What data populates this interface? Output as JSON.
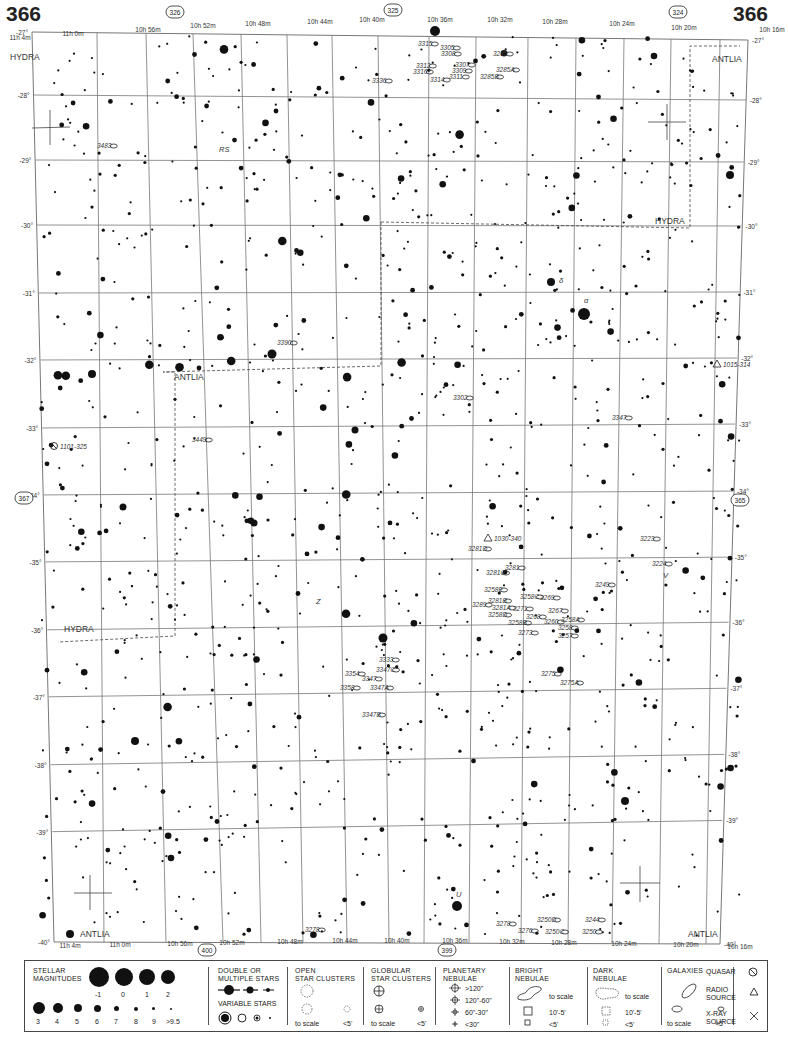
{
  "page": {
    "number_left": "366",
    "number_right": "366"
  },
  "adjacent_charts": {
    "top": "325",
    "top_left": "326",
    "top_right": "324",
    "bottom_left": "400",
    "bottom_right": "399",
    "left": "367",
    "right": "365"
  },
  "ra_labels_top": [
    "11h 4m",
    "11h 0m",
    "10h 56m",
    "10h 52m",
    "10h 48m",
    "10h 44m",
    "10h 40m",
    "10h 36m",
    "10h 32m",
    "10h 28m",
    "10h 24m",
    "10h 20m",
    "10h 16m"
  ],
  "ra_labels_bottom": [
    "11h 4m",
    "11h 0m",
    "10h 56m",
    "10h 52m",
    "10h 48m",
    "10h 44m",
    "10h 40m",
    "10h 36m",
    "10h 32m",
    "10h 28m",
    "10h 24m",
    "10h 20m",
    "10h 16m"
  ],
  "dec_labels": [
    "-27°",
    "-28°",
    "-29°",
    "-30°",
    "-31°",
    "-32°",
    "-33°",
    "-34°",
    "-35°",
    "-36°",
    "-37°",
    "-38°",
    "-39°",
    "-40°"
  ],
  "constellations": [
    {
      "name": "HYDRA",
      "x": 10,
      "y": 60
    },
    {
      "name": "ANTLIA",
      "x": 712,
      "y": 62
    },
    {
      "name": "HYDRA",
      "x": 655,
      "y": 224
    },
    {
      "name": "ANTLIA",
      "x": 174,
      "y": 380
    },
    {
      "name": "HYDRA",
      "x": 64,
      "y": 632
    },
    {
      "name": "ANTLIA",
      "x": 80,
      "y": 937
    },
    {
      "name": "ANTLIA",
      "x": 688,
      "y": 937
    }
  ],
  "objects": [
    {
      "label": "3315",
      "x": 418,
      "y": 46,
      "type": "galaxy"
    },
    {
      "label": "3305",
      "x": 440,
      "y": 50,
      "type": "galaxy"
    },
    {
      "label": "3308",
      "x": 441,
      "y": 56,
      "type": "galaxy"
    },
    {
      "label": "3312",
      "x": 416,
      "y": 68,
      "type": "galaxy"
    },
    {
      "label": "3307",
      "x": 455,
      "y": 67,
      "type": "galaxy"
    },
    {
      "label": "3316",
      "x": 413,
      "y": 74,
      "type": "galaxy"
    },
    {
      "label": "3309",
      "x": 452,
      "y": 73,
      "type": "galaxy"
    },
    {
      "label": "3311",
      "x": 449,
      "y": 79,
      "type": "galaxy"
    },
    {
      "label": "3314",
      "x": 430,
      "y": 82,
      "type": "galaxy"
    },
    {
      "label": "3285",
      "x": 493,
      "y": 56,
      "type": "galaxy"
    },
    {
      "label": "3285A",
      "x": 496,
      "y": 72,
      "type": "galaxy"
    },
    {
      "label": "3285B",
      "x": 480,
      "y": 79,
      "type": "galaxy"
    },
    {
      "label": "3336",
      "x": 372,
      "y": 83,
      "type": "galaxy"
    },
    {
      "label": "3483",
      "x": 97,
      "y": 148,
      "type": "galaxy"
    },
    {
      "label": "RS",
      "x": 219,
      "y": 152,
      "type": "variable-star"
    },
    {
      "label": "δ",
      "x": 559,
      "y": 283,
      "type": "star-designation"
    },
    {
      "label": "α",
      "x": 584,
      "y": 303,
      "type": "star-designation"
    },
    {
      "label": "3390",
      "x": 277,
      "y": 345,
      "type": "galaxy"
    },
    {
      "label": "1015-314",
      "x": 725,
      "y": 366,
      "type": "radio-source"
    },
    {
      "label": "3302",
      "x": 453,
      "y": 400,
      "type": "galaxy"
    },
    {
      "label": "3347",
      "x": 612,
      "y": 420,
      "type": "galaxy"
    },
    {
      "label": "3449",
      "x": 192,
      "y": 442,
      "type": "galaxy"
    },
    {
      "label": "1101-325",
      "x": 60,
      "y": 448,
      "type": "quasar"
    },
    {
      "label": "1030-340",
      "x": 496,
      "y": 540,
      "type": "radio-source"
    },
    {
      "label": "3281D",
      "x": 468,
      "y": 551,
      "type": "galaxy"
    },
    {
      "label": "3223",
      "x": 640,
      "y": 541,
      "type": "galaxy"
    },
    {
      "label": "3224",
      "x": 652,
      "y": 566,
      "type": "galaxy"
    },
    {
      "label": "V",
      "x": 663,
      "y": 578,
      "type": "variable-star"
    },
    {
      "label": "3281C",
      "x": 486,
      "y": 575,
      "type": "galaxy"
    },
    {
      "label": "3281",
      "x": 505,
      "y": 570,
      "type": "galaxy"
    },
    {
      "label": "3249",
      "x": 595,
      "y": 587,
      "type": "galaxy"
    },
    {
      "label": "3258E",
      "x": 484,
      "y": 592,
      "type": "galaxy"
    },
    {
      "label": "3258C",
      "x": 520,
      "y": 599,
      "type": "galaxy"
    },
    {
      "label": "3269",
      "x": 540,
      "y": 600,
      "type": "galaxy"
    },
    {
      "label": "3281B",
      "x": 488,
      "y": 603,
      "type": "galaxy"
    },
    {
      "label": "3289",
      "x": 472,
      "y": 607,
      "type": "galaxy"
    },
    {
      "label": "3281A",
      "x": 492,
      "y": 610,
      "type": "galaxy"
    },
    {
      "label": "3271",
      "x": 513,
      "y": 611,
      "type": "galaxy"
    },
    {
      "label": "3267",
      "x": 548,
      "y": 613,
      "type": "galaxy"
    },
    {
      "label": "3258D",
      "x": 488,
      "y": 617,
      "type": "galaxy"
    },
    {
      "label": "3268",
      "x": 526,
      "y": 619,
      "type": "galaxy"
    },
    {
      "label": "3260",
      "x": 544,
      "y": 624,
      "type": "galaxy"
    },
    {
      "label": "3258A",
      "x": 561,
      "y": 622,
      "type": "galaxy"
    },
    {
      "label": "3258B",
      "x": 508,
      "y": 625,
      "type": "galaxy"
    },
    {
      "label": "3258",
      "x": 558,
      "y": 630,
      "type": "galaxy"
    },
    {
      "label": "3273",
      "x": 518,
      "y": 635,
      "type": "galaxy"
    },
    {
      "label": "3257",
      "x": 558,
      "y": 638,
      "type": "galaxy"
    },
    {
      "label": "Z",
      "x": 316,
      "y": 604,
      "type": "variable-star"
    },
    {
      "label": "3333",
      "x": 379,
      "y": 662,
      "type": "galaxy"
    },
    {
      "label": "3347C",
      "x": 376,
      "y": 672,
      "type": "galaxy"
    },
    {
      "label": "3354",
      "x": 345,
      "y": 676,
      "type": "galaxy"
    },
    {
      "label": "3347",
      "x": 362,
      "y": 681,
      "type": "galaxy"
    },
    {
      "label": "3358",
      "x": 340,
      "y": 690,
      "type": "galaxy"
    },
    {
      "label": "3347A",
      "x": 370,
      "y": 690,
      "type": "galaxy"
    },
    {
      "label": "3275",
      "x": 541,
      "y": 676,
      "type": "galaxy"
    },
    {
      "label": "3275A",
      "x": 560,
      "y": 685,
      "type": "galaxy"
    },
    {
      "label": "3347B",
      "x": 362,
      "y": 717,
      "type": "galaxy"
    },
    {
      "label": "U",
      "x": 456,
      "y": 897,
      "type": "variable-star"
    },
    {
      "label": "3278",
      "x": 305,
      "y": 932,
      "type": "galaxy"
    },
    {
      "label": "3278",
      "x": 496,
      "y": 926,
      "type": "galaxy"
    },
    {
      "label": "3276",
      "x": 518,
      "y": 933,
      "type": "galaxy"
    },
    {
      "label": "3250D",
      "x": 537,
      "y": 922,
      "type": "galaxy"
    },
    {
      "label": "3244",
      "x": 585,
      "y": 922,
      "type": "galaxy"
    },
    {
      "label": "3250C",
      "x": 545,
      "y": 934,
      "type": "galaxy"
    },
    {
      "label": "3250",
      "x": 582,
      "y": 934,
      "type": "galaxy"
    }
  ],
  "legend": {
    "stellar_magnitudes": {
      "title_line1": "STELLAR",
      "title_line2": "MAGNITUDES",
      "large": [
        "-1",
        "0",
        "1",
        "2"
      ],
      "small": [
        "3",
        "4",
        "5",
        "6",
        "7",
        "8",
        "9",
        ">9.5"
      ]
    },
    "double_stars": {
      "title_line1": "DOUBLE OR",
      "title_line2": "MULTIPLE STARS"
    },
    "variable_stars": {
      "title": "VARIABLE STARS"
    },
    "open_clusters": {
      "title_line1": "OPEN",
      "title_line2": "STAR CLUSTERS",
      "to_scale": "to scale",
      "small": "<5'"
    },
    "globular_clusters": {
      "title_line1": "GLOBULAR",
      "title_line2": "STAR CLUSTERS",
      "to_scale": "to scale",
      "small": "<5'"
    },
    "planetary_nebulae": {
      "title_line1": "PLANETARY",
      "title_line2": "NEBULAE",
      "sizes": [
        ">120\"",
        "120\"-60\"",
        "60\"-30\"",
        "<30\""
      ]
    },
    "bright_nebulae": {
      "title_line1": "BRIGHT",
      "title_line2": "NEBULAE",
      "to_scale": "to scale",
      "mid": "10'-5'",
      "small": "<5'"
    },
    "dark_nebulae": {
      "title_line1": "DARK",
      "title_line2": "NEBULAE",
      "to_scale": "to scale",
      "mid": "10'-5'",
      "small": "<5'"
    },
    "galaxies": {
      "title": "GALAXIES",
      "to_scale": "to scale",
      "small": "<5'"
    },
    "quasar": {
      "label": "QUASAR"
    },
    "radio_source": {
      "label_line1": "RADIO",
      "label_line2": "SOURCE"
    },
    "xray_source": {
      "label_line1": "X-RAY",
      "label_line2": "SOURCE"
    }
  }
}
